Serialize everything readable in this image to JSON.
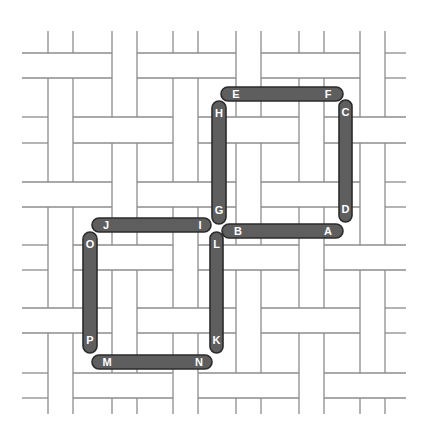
{
  "diagram": {
    "type": "basket-weave-tiling-with-matchsticks",
    "colors": {
      "background": "#ffffff",
      "weave_line": "#8c8c8c",
      "stick_fill": "#5e5e5e",
      "stick_stroke": "#2b2b2b",
      "label": "#ffffff"
    },
    "weave": {
      "bounds": {
        "x0": 22,
        "x1": 406,
        "y0": 31,
        "y1": 414
      },
      "column_strips": [
        [
          48,
          73
        ],
        [
          112,
          137
        ],
        [
          173,
          198
        ],
        [
          236,
          261
        ],
        [
          299,
          324
        ],
        [
          360,
          385
        ]
      ],
      "row_strips": [
        [
          53,
          78
        ],
        [
          117,
          143
        ],
        [
          182,
          207
        ],
        [
          245,
          270
        ],
        [
          308,
          333
        ],
        [
          373,
          398
        ]
      ],
      "rule": "crossing (col i,row j): horizontal strip on top if (i+j) even, vertical strip on top if odd"
    },
    "sticks": [
      {
        "id": "EF",
        "orient": "h",
        "x": 221,
        "y": 87,
        "w": 122,
        "h": 14,
        "labels": [
          {
            "text": "E",
            "dx": 15
          },
          {
            "text": "F",
            "dx": 107
          }
        ]
      },
      {
        "id": "HG",
        "orient": "v",
        "x": 212,
        "y": 101,
        "w": 14,
        "h": 123,
        "labels": [
          {
            "text": "H",
            "dy": 16
          },
          {
            "text": "G",
            "dy": 113
          }
        ]
      },
      {
        "id": "CD",
        "orient": "v",
        "x": 339,
        "y": 100,
        "w": 13,
        "h": 122,
        "labels": [
          {
            "text": "C",
            "dy": 16
          },
          {
            "text": "D",
            "dy": 113
          }
        ]
      },
      {
        "id": "BA",
        "orient": "h",
        "x": 222,
        "y": 224,
        "w": 121,
        "h": 14,
        "labels": [
          {
            "text": "B",
            "dx": 16
          },
          {
            "text": "A",
            "dx": 106
          }
        ]
      },
      {
        "id": "JI",
        "orient": "h",
        "x": 92,
        "y": 218,
        "w": 119,
        "h": 14,
        "labels": [
          {
            "text": "J",
            "dx": 14
          },
          {
            "text": "I",
            "dx": 108
          }
        ]
      },
      {
        "id": "OP",
        "orient": "v",
        "x": 83,
        "y": 232,
        "w": 14,
        "h": 121,
        "labels": [
          {
            "text": "O",
            "dy": 16
          },
          {
            "text": "P",
            "dy": 112
          }
        ]
      },
      {
        "id": "LK",
        "orient": "v",
        "x": 210,
        "y": 232,
        "w": 13,
        "h": 121,
        "labels": [
          {
            "text": "L",
            "dy": 16
          },
          {
            "text": "K",
            "dy": 112
          }
        ]
      },
      {
        "id": "MN",
        "orient": "h",
        "x": 92,
        "y": 355,
        "w": 120,
        "h": 14,
        "labels": [
          {
            "text": "M",
            "dx": 15
          },
          {
            "text": "N",
            "dx": 107
          }
        ]
      }
    ],
    "point_labels": [
      "A",
      "B",
      "C",
      "D",
      "E",
      "F",
      "G",
      "H",
      "I",
      "J",
      "K",
      "L",
      "M",
      "N",
      "O",
      "P"
    ]
  }
}
